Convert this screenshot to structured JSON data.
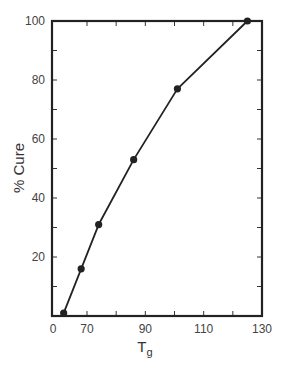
{
  "chart_data": {
    "type": "line",
    "title": "",
    "xlabel": "Tg",
    "xlabel_main": "T",
    "xlabel_sub": "g",
    "ylabel": "% Cure",
    "x_tick_labels": [
      "0",
      "70",
      "90",
      "110",
      "130"
    ],
    "x_tick_values_labeled": [
      58,
      70,
      90,
      110,
      130
    ],
    "x_minor_ticks": [
      80,
      100,
      120
    ],
    "y_tick_labels": [
      "20",
      "40",
      "60",
      "80",
      "100"
    ],
    "y_tick_values_labeled": [
      20,
      40,
      60,
      80,
      100
    ],
    "y_minor_ticks": [
      10,
      30,
      50,
      70,
      90
    ],
    "xlim": [
      58,
      130
    ],
    "ylim": [
      0,
      100
    ],
    "x_axis_break_note": "left edge labeled 0 (axis break)",
    "grid": false,
    "legend": null,
    "series": [
      {
        "name": "% Cure vs Tg",
        "marker": "filled-circle",
        "color": "#222222",
        "x": [
          62,
          68,
          74,
          86,
          101,
          125
        ],
        "y": [
          1,
          16,
          31,
          53,
          77,
          100
        ]
      }
    ]
  }
}
